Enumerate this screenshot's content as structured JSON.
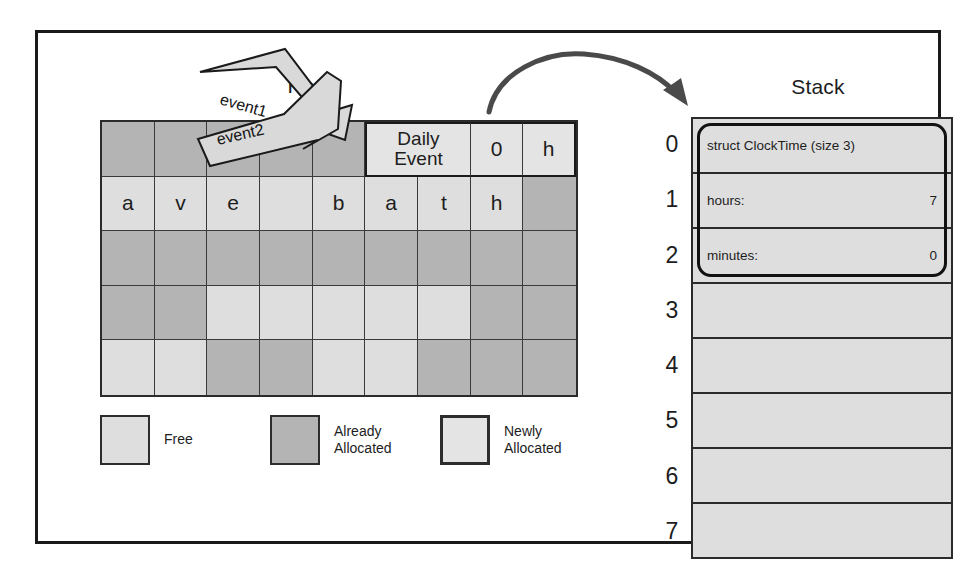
{
  "diagram": {
    "heap": {
      "title": "Heap",
      "columns": 9,
      "rows": 5,
      "cells": [
        [
          {
            "label": "",
            "state": "alloc"
          },
          {
            "label": "",
            "state": "alloc"
          },
          {
            "label": "",
            "state": "alloc"
          },
          {
            "label": "",
            "state": "alloc"
          },
          {
            "label": "",
            "state": "alloc"
          },
          {
            "label": "Daily\nEvent",
            "state": "new",
            "span": 2
          },
          {
            "label": "0",
            "state": "new"
          },
          {
            "label": "h",
            "state": "new"
          }
        ],
        [
          {
            "label": "a",
            "state": "free"
          },
          {
            "label": "v",
            "state": "free"
          },
          {
            "label": "e",
            "state": "free"
          },
          {
            "label": "",
            "state": "free"
          },
          {
            "label": "b",
            "state": "free"
          },
          {
            "label": "a",
            "state": "free"
          },
          {
            "label": "t",
            "state": "free"
          },
          {
            "label": "h",
            "state": "free"
          },
          {
            "label": "",
            "state": "alloc"
          }
        ],
        [
          {
            "label": "",
            "state": "alloc"
          },
          {
            "label": "",
            "state": "alloc"
          },
          {
            "label": "",
            "state": "alloc"
          },
          {
            "label": "",
            "state": "alloc"
          },
          {
            "label": "",
            "state": "alloc"
          },
          {
            "label": "",
            "state": "alloc"
          },
          {
            "label": "",
            "state": "alloc"
          },
          {
            "label": "",
            "state": "alloc"
          },
          {
            "label": "",
            "state": "alloc"
          }
        ],
        [
          {
            "label": "",
            "state": "alloc"
          },
          {
            "label": "",
            "state": "alloc"
          },
          {
            "label": "",
            "state": "free"
          },
          {
            "label": "",
            "state": "free"
          },
          {
            "label": "",
            "state": "free"
          },
          {
            "label": "",
            "state": "free"
          },
          {
            "label": "",
            "state": "free"
          },
          {
            "label": "",
            "state": "alloc"
          },
          {
            "label": "",
            "state": "alloc"
          }
        ],
        [
          {
            "label": "",
            "state": "free"
          },
          {
            "label": "",
            "state": "free"
          },
          {
            "label": "",
            "state": "alloc"
          },
          {
            "label": "",
            "state": "alloc"
          },
          {
            "label": "",
            "state": "free"
          },
          {
            "label": "",
            "state": "free"
          },
          {
            "label": "",
            "state": "alloc"
          },
          {
            "label": "",
            "state": "alloc"
          },
          {
            "label": "",
            "state": "alloc"
          }
        ]
      ]
    },
    "legend": {
      "items": [
        {
          "label": "Free",
          "state": "free"
        },
        {
          "label": "Already\nAllocated",
          "state": "alloc"
        },
        {
          "label": "Newly\nAllocated",
          "state": "new"
        }
      ]
    },
    "pointers": [
      {
        "name": "event1",
        "label": "event1"
      },
      {
        "name": "event2",
        "label": "event2"
      }
    ],
    "stack": {
      "title": "Stack",
      "indices": [
        "0",
        "1",
        "2",
        "3",
        "4",
        "5",
        "6",
        "7"
      ],
      "slots": [
        {
          "title": "struct ClockTime (size 3)",
          "key": "",
          "value": "",
          "highlighted": true
        },
        {
          "title": "",
          "key": "hours:",
          "value": "7",
          "highlighted": true
        },
        {
          "title": "",
          "key": "minutes:",
          "value": "0",
          "highlighted": true
        },
        {
          "title": "",
          "key": "",
          "value": "",
          "highlighted": false
        },
        {
          "title": "",
          "key": "",
          "value": "",
          "highlighted": false
        },
        {
          "title": "",
          "key": "",
          "value": "",
          "highlighted": false
        },
        {
          "title": "",
          "key": "",
          "value": "",
          "highlighted": false
        },
        {
          "title": "",
          "key": "",
          "value": "",
          "highlighted": false
        }
      ]
    },
    "colors": {
      "free": "#dedede",
      "already_allocated": "#b4b4b4",
      "newly_allocated": "#e4e4e4",
      "border": "#2b2b2b",
      "arrow": "#4a4a4a"
    }
  }
}
